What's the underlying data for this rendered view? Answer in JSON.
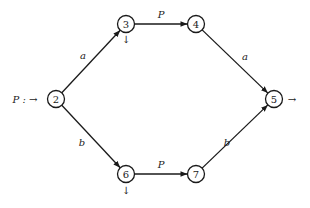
{
  "diagram": {
    "type": "state-graph",
    "input_label": "P : →",
    "nodes": [
      {
        "id": "2",
        "label": "2",
        "annotation": ""
      },
      {
        "id": "3",
        "label": "3",
        "annotation": "↓"
      },
      {
        "id": "4",
        "label": "4",
        "annotation": ""
      },
      {
        "id": "5",
        "label": "5",
        "annotation": "→"
      },
      {
        "id": "6",
        "label": "6",
        "annotation": "↓"
      },
      {
        "id": "7",
        "label": "7",
        "annotation": ""
      }
    ],
    "edges": [
      {
        "from": "2",
        "to": "3",
        "label": "a"
      },
      {
        "from": "3",
        "to": "4",
        "label": "P"
      },
      {
        "from": "4",
        "to": "5",
        "label": "a"
      },
      {
        "from": "2",
        "to": "6",
        "label": "b"
      },
      {
        "from": "6",
        "to": "7",
        "label": "P"
      },
      {
        "from": "7",
        "to": "5",
        "label": "b"
      }
    ]
  }
}
